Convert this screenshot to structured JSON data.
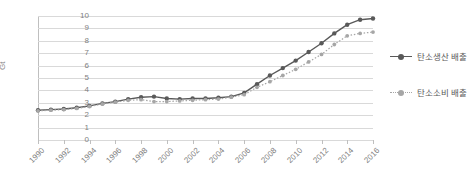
{
  "chart_data": {
    "type": "line",
    "title": "",
    "xlabel": "",
    "ylabel": "Gt",
    "ylim": [
      0,
      10
    ],
    "ytick_step": 1,
    "yticks": [
      "10",
      "9",
      "8",
      "7",
      "6",
      "5",
      "4",
      "3",
      "2",
      "1",
      "0"
    ],
    "grid": true,
    "legend_position": "right",
    "x": [
      1990,
      1991,
      1992,
      1993,
      1994,
      1995,
      1996,
      1997,
      1998,
      1999,
      2000,
      2001,
      2002,
      2003,
      2004,
      2005,
      2006,
      2007,
      2008,
      2009,
      2010,
      2011,
      2012,
      2013,
      2014,
      2015,
      2016
    ],
    "xtick_labels": [
      "1990",
      "1992",
      "1994",
      "1996",
      "1998",
      "2000",
      "2002",
      "2004",
      "2006",
      "2008",
      "2010",
      "2012",
      "2014",
      "2016"
    ],
    "series": [
      {
        "name": "탄소생산 배출",
        "style": "solid",
        "color": "#595959",
        "marker": "circle",
        "values": [
          2.4,
          2.45,
          2.5,
          2.6,
          2.75,
          2.95,
          3.1,
          3.3,
          3.45,
          3.5,
          3.35,
          3.3,
          3.35,
          3.35,
          3.4,
          3.5,
          3.8,
          4.5,
          5.2,
          5.8,
          6.4,
          7.1,
          7.8,
          8.6,
          9.3,
          9.7,
          9.8
        ]
      },
      {
        "name": "탄소소비 배출",
        "style": "dotted",
        "color": "#a6a6a6",
        "marker": "circle",
        "values": [
          2.35,
          2.4,
          2.45,
          2.55,
          2.7,
          2.9,
          3.05,
          3.2,
          3.25,
          3.1,
          3.1,
          3.15,
          3.2,
          3.25,
          3.3,
          3.45,
          3.65,
          4.25,
          4.7,
          5.2,
          5.7,
          6.3,
          6.9,
          7.7,
          8.4,
          8.6,
          8.7
        ]
      }
    ]
  }
}
